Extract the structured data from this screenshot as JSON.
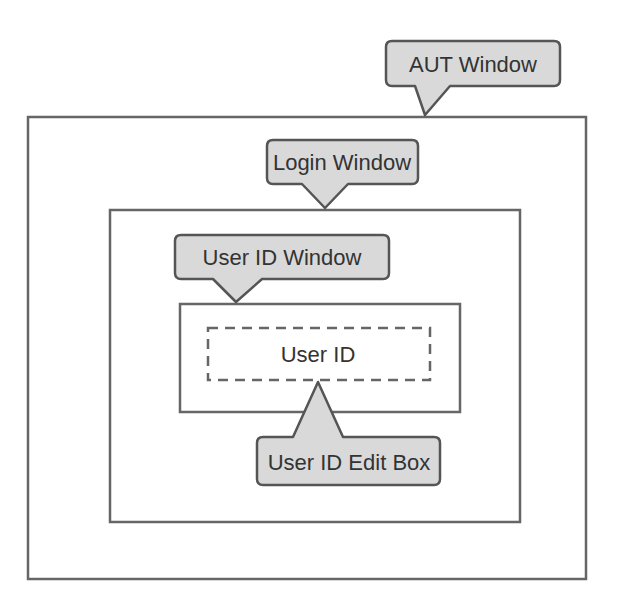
{
  "diagram": {
    "boxes": {
      "aut_window": {
        "label": "AUT Window"
      },
      "login_window": {
        "label": "Login Window"
      },
      "user_id_window": {
        "label": "User ID Window"
      },
      "user_id_edit_box": {
        "label": "User ID Edit Box",
        "inner_text": "User ID"
      }
    },
    "colors": {
      "frame": "#666666",
      "callout_fill": "#d9d9d9",
      "callout_stroke": "#555555",
      "text": "#333333"
    }
  }
}
